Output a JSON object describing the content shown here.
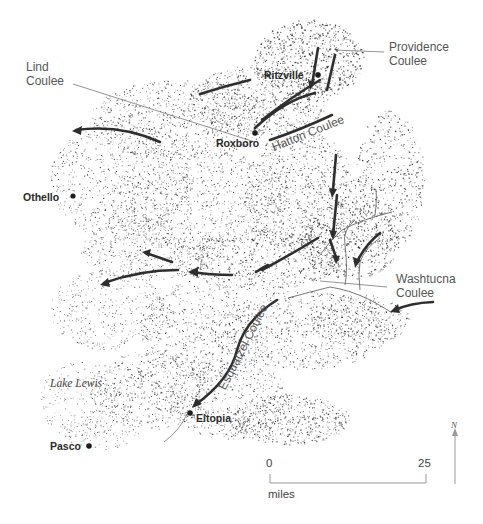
{
  "map": {
    "title": "Channeled scablands coulees map",
    "labels": {
      "providence": "Providence\nCoulee",
      "providence_l1": "Providence",
      "providence_l2": "Coulee",
      "lind_l1": "Lind",
      "lind_l2": "Coulee",
      "hatton": "Hatton Coulee",
      "washtucna_l1": "Washtucna",
      "washtucna_l2": "Coulee",
      "esquatzel": "Esquatzel Coulee",
      "lake_lewis": "Lake Lewis"
    },
    "towns": [
      {
        "name": "Ritzville",
        "x": 318,
        "y": 75
      },
      {
        "name": "Roxboro",
        "x": 255,
        "y": 133
      },
      {
        "name": "Othello",
        "x": 73,
        "y": 196
      },
      {
        "name": "Eltopia",
        "x": 190,
        "y": 412
      },
      {
        "name": "Pasco",
        "x": 88,
        "y": 445
      }
    ],
    "scale": {
      "start_label": "0",
      "end_label": "25",
      "unit": "miles"
    },
    "north_arrow": {
      "label": "N"
    },
    "colors": {
      "ink": "#2e2e2e",
      "text": "#3a3a3a",
      "background": "#ffffff"
    }
  }
}
